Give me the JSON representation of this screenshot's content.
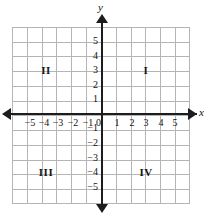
{
  "chart_data": {
    "type": "scatter",
    "title": "",
    "subtitle": "",
    "xlabel": "x",
    "ylabel": "y",
    "xlim": [
      -6,
      6
    ],
    "ylim": [
      -6,
      6
    ],
    "grid": true,
    "legend": null,
    "series": [],
    "x_tick_labels": [
      "−5",
      "−4",
      "−3",
      "−2",
      "−1",
      "1",
      "2",
      "3",
      "4",
      "5"
    ],
    "x_tick_values": [
      -5,
      -4,
      -3,
      -2,
      -1,
      1,
      2,
      3,
      4,
      5
    ],
    "y_tick_labels": [
      "5",
      "4",
      "3",
      "2",
      "1",
      "−1",
      "−2",
      "−3",
      "−4",
      "−5"
    ],
    "y_tick_values": [
      5,
      4,
      3,
      2,
      1,
      -1,
      -2,
      -3,
      -4,
      -5
    ],
    "origin_label": "0",
    "annotations": [
      {
        "text": "I",
        "x": 3,
        "y": 2.5
      },
      {
        "text": "II",
        "x": -3,
        "y": 2.5
      },
      {
        "text": "III",
        "x": -3,
        "y": -3.5
      },
      {
        "text": "IV",
        "x": 3,
        "y": -3.5
      }
    ],
    "grid_color": "#b5b5b5",
    "axis_color": "#1d1d1d",
    "background_color": "#ffffff"
  },
  "axes": {
    "x_name": "x",
    "y_name": "y",
    "origin": "0"
  },
  "x_ticks": [
    {
      "label": "−5",
      "left": "30px"
    },
    {
      "label": "−4",
      "left": "44px"
    },
    {
      "label": "−3",
      "left": "58px"
    },
    {
      "label": "−2",
      "left": "73px"
    },
    {
      "label": "−1",
      "left": "88px"
    },
    {
      "label": "1",
      "left": "117px"
    },
    {
      "label": "2",
      "left": "132px"
    },
    {
      "label": "3",
      "left": "146px"
    },
    {
      "label": "4",
      "left": "161px"
    },
    {
      "label": "5",
      "left": "175px"
    }
  ],
  "y_ticks": [
    {
      "label": "5",
      "top": "41px"
    },
    {
      "label": "4",
      "top": "56px"
    },
    {
      "label": "3",
      "top": "70px"
    },
    {
      "label": "2",
      "top": "85px"
    },
    {
      "label": "1",
      "top": "99px"
    },
    {
      "label": "−1",
      "top": "128px"
    },
    {
      "label": "−2",
      "top": "143px"
    },
    {
      "label": "−3",
      "top": "158px"
    },
    {
      "label": "−4",
      "top": "172px"
    },
    {
      "label": "−5",
      "top": "187px"
    }
  ],
  "quadrants": [
    {
      "label": "II",
      "left": "46px",
      "top": "70px"
    },
    {
      "label": "I",
      "left": "146px",
      "top": "70px"
    },
    {
      "label": "III",
      "left": "46px",
      "top": "172px"
    },
    {
      "label": "IV",
      "left": "146px",
      "top": "172px"
    }
  ]
}
